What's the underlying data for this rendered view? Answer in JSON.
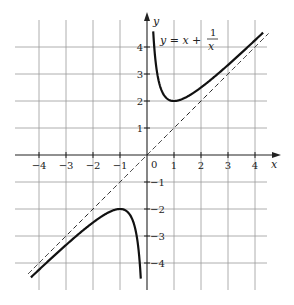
{
  "chart_data": {
    "type": "line",
    "title": "",
    "function_label": {
      "lhs": "y = x +",
      "num": "1",
      "den": "x"
    },
    "xlabel": "x",
    "ylabel": "y",
    "xlim": [
      -4.5,
      4.5
    ],
    "ylim": [
      -4.5,
      4.5
    ],
    "grid": true,
    "x_ticks": [
      -4,
      -3,
      -2,
      -1,
      1,
      2,
      3,
      4
    ],
    "y_ticks": [
      -4,
      -3,
      -2,
      -1,
      1,
      2,
      3,
      4
    ],
    "x_tick_labels": [
      "−4",
      "−3",
      "−2",
      "−1",
      "1",
      "2",
      "3",
      "4"
    ],
    "y_tick_labels": [
      "−4",
      "−3",
      "−2",
      "−1",
      "1",
      "2",
      "3",
      "4"
    ],
    "origin_label": "0",
    "series": [
      {
        "name": "y = x + 1/x (x>0)",
        "style": "solid",
        "x_range": [
          0.23,
          4.3
        ],
        "formula": "x + 1/x"
      },
      {
        "name": "y = x + 1/x (x<0)",
        "style": "solid",
        "x_range": [
          -4.3,
          -0.23
        ],
        "formula": "x + 1/x"
      },
      {
        "name": "asymptote y = x",
        "style": "dashed",
        "x_range": [
          -4.4,
          4.5
        ],
        "formula": "x"
      }
    ],
    "key_points": [
      {
        "x": 1,
        "y": 2,
        "label": "local minimum"
      },
      {
        "x": -1,
        "y": -2,
        "label": "local maximum"
      }
    ]
  }
}
